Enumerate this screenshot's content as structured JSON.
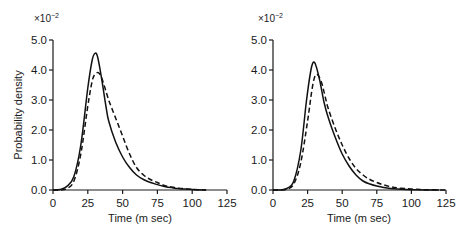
{
  "chart_data": [
    {
      "type": "line",
      "title": "",
      "xlabel": "Time (m sec)",
      "ylabel": "Probability density",
      "y_multiplier": "×10^-2",
      "xlim": [
        0,
        125
      ],
      "ylim": [
        0,
        5.0
      ],
      "xticks": [
        "0",
        "25",
        "50",
        "75",
        "100",
        "125"
      ],
      "yticks": [
        "0.0",
        "1.0",
        "2.0",
        "3.0",
        "4.0",
        "5.0"
      ],
      "grid": false,
      "legend": null,
      "series": [
        {
          "name": "solid",
          "style": "solid",
          "x": [
            0,
            5,
            10,
            15,
            20,
            25,
            28,
            30,
            32,
            35,
            38,
            40,
            45,
            50,
            55,
            60,
            65,
            70,
            75,
            80,
            85,
            90,
            95,
            100,
            110
          ],
          "y": [
            0.0,
            0.02,
            0.12,
            0.45,
            1.5,
            3.4,
            4.3,
            4.55,
            4.45,
            3.7,
            2.8,
            2.3,
            1.6,
            1.1,
            0.75,
            0.5,
            0.35,
            0.25,
            0.18,
            0.12,
            0.08,
            0.05,
            0.03,
            0.02,
            0.0
          ]
        },
        {
          "name": "dashed",
          "style": "dashed",
          "x": [
            0,
            5,
            10,
            15,
            20,
            25,
            28,
            30,
            33,
            36,
            40,
            45,
            50,
            55,
            60,
            65,
            70,
            75,
            80,
            85,
            90,
            95,
            100,
            110
          ],
          "y": [
            0.0,
            0.0,
            0.05,
            0.3,
            1.2,
            2.8,
            3.6,
            3.85,
            3.9,
            3.6,
            3.0,
            2.4,
            1.8,
            1.2,
            0.75,
            0.5,
            0.35,
            0.25,
            0.15,
            0.1,
            0.06,
            0.04,
            0.02,
            0.0
          ]
        }
      ]
    },
    {
      "type": "line",
      "title": "",
      "xlabel": "Time (m sec)",
      "ylabel": "",
      "y_multiplier": "×10^-2",
      "xlim": [
        0,
        125
      ],
      "ylim": [
        0,
        5.0
      ],
      "xticks": [
        "0",
        "25",
        "50",
        "75",
        "100",
        "125"
      ],
      "yticks": [
        "0.0",
        "1.0",
        "2.0",
        "3.0",
        "4.0",
        "5.0"
      ],
      "grid": false,
      "legend": null,
      "series": [
        {
          "name": "solid",
          "style": "solid",
          "x": [
            0,
            5,
            10,
            15,
            20,
            24,
            27,
            29,
            31,
            34,
            37,
            40,
            45,
            50,
            55,
            60,
            65,
            70,
            75,
            80,
            85,
            90,
            100,
            110,
            120
          ],
          "y": [
            0.0,
            0.0,
            0.05,
            0.3,
            1.3,
            2.9,
            3.9,
            4.25,
            4.15,
            3.6,
            2.9,
            2.4,
            1.75,
            1.2,
            0.8,
            0.5,
            0.3,
            0.2,
            0.13,
            0.08,
            0.05,
            0.03,
            0.01,
            0.0,
            0.0
          ]
        },
        {
          "name": "dashed",
          "style": "dashed",
          "x": [
            0,
            5,
            10,
            15,
            20,
            25,
            28,
            30,
            32,
            35,
            38,
            40,
            45,
            50,
            55,
            60,
            65,
            70,
            75,
            80,
            85,
            90,
            100,
            110,
            125
          ],
          "y": [
            0.0,
            0.0,
            0.02,
            0.2,
            0.9,
            2.3,
            3.3,
            3.75,
            3.85,
            3.6,
            3.05,
            2.7,
            2.05,
            1.5,
            1.05,
            0.72,
            0.5,
            0.35,
            0.25,
            0.17,
            0.11,
            0.07,
            0.03,
            0.01,
            0.0
          ]
        }
      ]
    }
  ],
  "panels": [
    {
      "exponent_base": "×10",
      "exponent_power": "−2",
      "ylabel": "Probability density",
      "xlabel": "Time (m sec)",
      "yticks": [
        "0.0",
        "1.0",
        "2.0",
        "3.0",
        "4.0",
        "5.0"
      ],
      "xticks": [
        "0",
        "25",
        "50",
        "75",
        "100",
        "125"
      ]
    },
    {
      "exponent_base": "×10",
      "exponent_power": "−2",
      "ylabel": "",
      "xlabel": "Time (m sec)",
      "yticks": [
        "0.0",
        "1.0",
        "2.0",
        "3.0",
        "4.0",
        "5.0"
      ],
      "xticks": [
        "0",
        "25",
        "50",
        "75",
        "100",
        "125"
      ]
    }
  ]
}
